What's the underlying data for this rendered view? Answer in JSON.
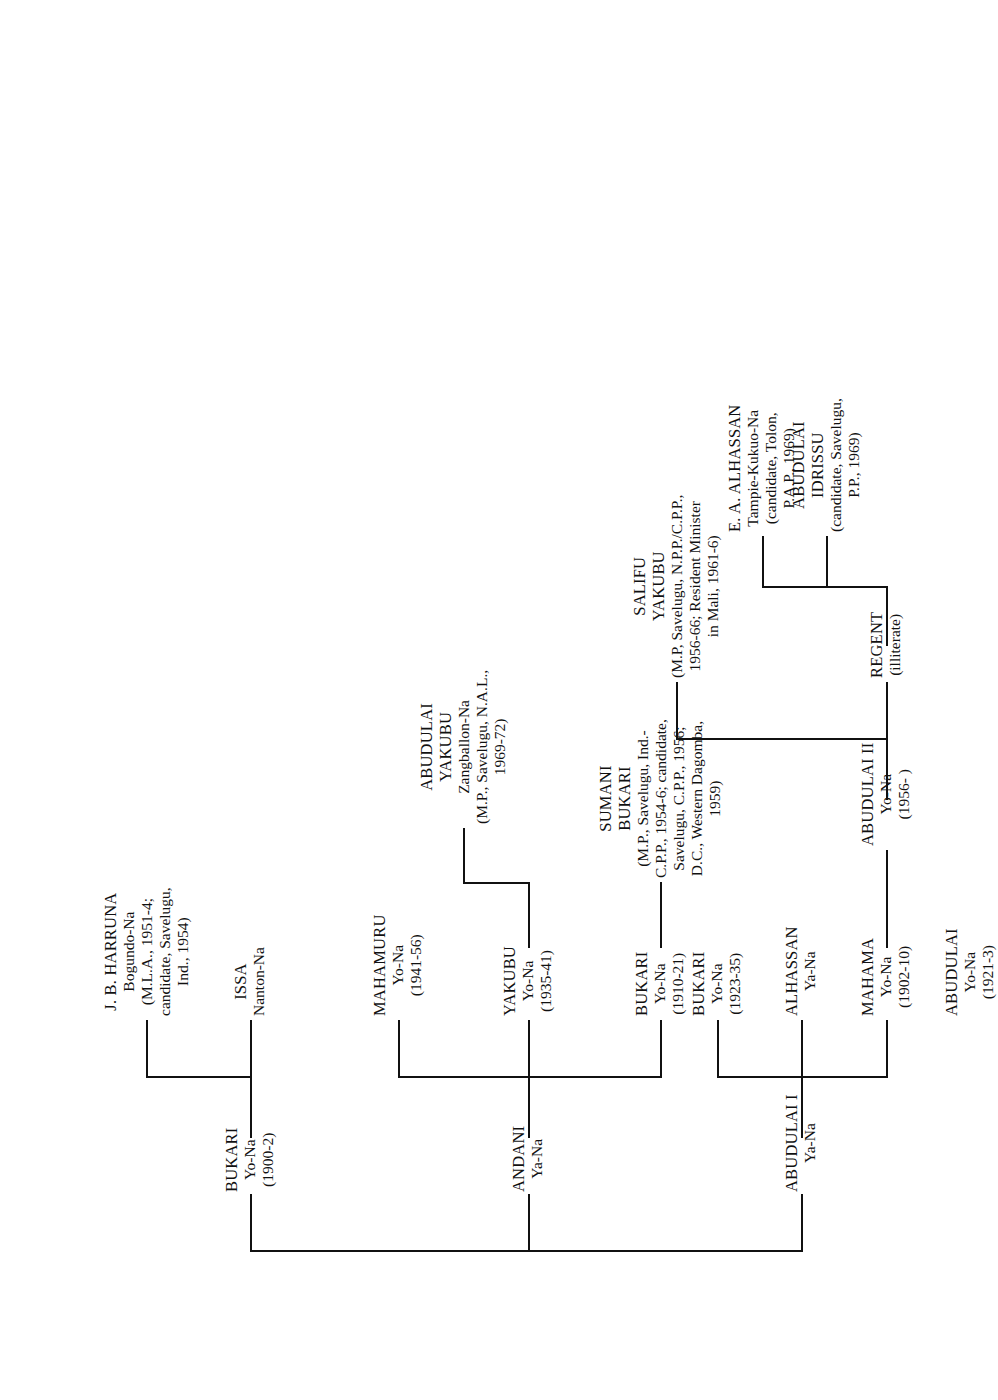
{
  "figure": {
    "type": "genealogical-tree",
    "orientation": "rotated-90-counterclockwise",
    "root_note": "Descent chart of the Yendi (Dagomba) royal lineage"
  },
  "nodes": {
    "abudulai_i": {
      "name": "ABUDULAI I",
      "title": "Ya-Na",
      "dates": "",
      "detail": ""
    },
    "andani": {
      "name": "ANDANI",
      "title": "Ya-Na",
      "dates": "",
      "detail": ""
    },
    "bukari_1900": {
      "name": "BUKARI",
      "title": "Yo-Na",
      "dates": "(1900-2)",
      "detail": ""
    },
    "issa": {
      "name": "ISSA",
      "title": "Nanton-Na",
      "dates": "",
      "detail": ""
    },
    "jb_harruna": {
      "name": "J. B. HARRUNA",
      "title": "Bogundo-Na",
      "dates": "",
      "detail": "(M.L.A., 1951-4;\ncandidate, Savelugu,\nInd., 1954)"
    },
    "bukari_1910": {
      "name": "BUKARI",
      "title": "Yo-Na",
      "dates": "(1910-21)",
      "detail": ""
    },
    "yakubu_1935": {
      "name": "YAKUBU",
      "title": "Yo-Na",
      "dates": "(1935-41)",
      "detail": ""
    },
    "mahamuru": {
      "name": "MAHAMURU",
      "title": "Yo-Na",
      "dates": "(1941-56)",
      "detail": ""
    },
    "sumani_bukari": {
      "name": "SUMANI",
      "name2": "BUKARI",
      "title": "",
      "dates": "",
      "detail": "(M.P., Savelugu, Ind.-\nC.P.P., 1954-6; candidate,\nSavelugu, C.P.P., 1956;\nD.C., Western Dagomba,\n1959)"
    },
    "abudulai_yakubu": {
      "name": "ABUDULAI",
      "name2": "YAKUBU",
      "title": "Zangballon-Na",
      "dates": "",
      "detail": "(M.P., Savelugu, N.A.L.,\n1969-72)"
    },
    "mahama": {
      "name": "MAHAMA",
      "title": "Yo-Na",
      "dates": "(1902-10)",
      "detail": ""
    },
    "alhassan": {
      "name": "ALHASSAN",
      "title": "Ya-Na",
      "dates": "",
      "detail": ""
    },
    "bukari_1923": {
      "name": "BUKARI",
      "title": "Yo-Na",
      "dates": "(1923-35)",
      "detail": ""
    },
    "abudulai_1921": {
      "name": "ABUDULAI",
      "title": "Yo-Na",
      "dates": "(1921-3)",
      "detail": ""
    },
    "abudulai_ii": {
      "name": "ABUDULAI II",
      "title": "Yo-Na",
      "dates": "(1956-  )",
      "detail": ""
    },
    "salifu_yakubu": {
      "name": "SALIFU",
      "name2": "YAKUBU",
      "title": "",
      "dates": "",
      "detail": "(M.P, Savelugu, N.P.P./C.P.P.,\n1956-66; Resident Minister\nin Mali, 1961-6)"
    },
    "regent": {
      "name": "REGENT",
      "title": "",
      "dates": "",
      "detail": "(illiterate)"
    },
    "abudulai_idrissu": {
      "name": "ABUDULAI",
      "name2": "IDRISSU",
      "title": "",
      "dates": "",
      "detail": "(candidate, Savelugu,\nP.P., 1969)"
    },
    "ea_alhassan": {
      "name": "E. A. ALHASSAN",
      "title": "Tampie-Kukuo-Na",
      "dates": "",
      "detail": "(candidate, Tolon,\nP.A.P., 1969)"
    }
  },
  "style": {
    "line_color": "#111111",
    "text_color": "#111111",
    "background": "#ffffff"
  }
}
